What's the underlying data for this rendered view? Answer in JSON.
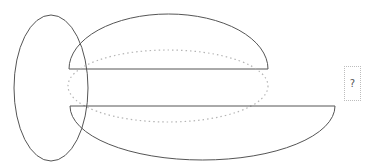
{
  "diagram": {
    "colors": {
      "stroke": "#555555",
      "dotted_stroke": "#b5b5b5",
      "background": "#ffffff"
    },
    "shapes": [
      {
        "id": "left-ellipse",
        "type": "ellipse",
        "style": "solid",
        "cx": 51,
        "cy": 88,
        "rx": 37,
        "ry": 73
      },
      {
        "id": "upper-half-ellipse",
        "type": "half-ellipse-top",
        "style": "solid",
        "cx": 168.5,
        "cy": 69,
        "rx": 99.5,
        "ry": 55
      },
      {
        "id": "dotted-ellipse",
        "type": "ellipse",
        "style": "dotted",
        "cx": 168,
        "cy": 86,
        "rx": 100,
        "ry": 36
      },
      {
        "id": "lower-half-ellipse",
        "type": "half-ellipse-bottom",
        "style": "solid",
        "cx": 202.5,
        "cy": 106,
        "rx": 132.5,
        "ry": 54
      }
    ],
    "placeholder_box": {
      "label": "?"
    }
  }
}
